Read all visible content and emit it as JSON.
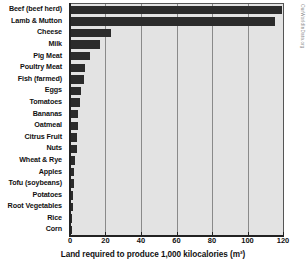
{
  "chart_data": {
    "type": "bar",
    "orientation": "horizontal",
    "title": "",
    "xlabel": "Land required to produce 1,000 kilocalories (m²)",
    "ylabel": "",
    "xlim": [
      0,
      120
    ],
    "xticks": [
      0,
      20,
      40,
      60,
      80,
      100,
      120
    ],
    "xtick_labels": [
      "0",
      "20",
      "40",
      "60",
      "80",
      "100",
      "120"
    ],
    "grid": true,
    "grid_axis": "x",
    "legend": false,
    "bar_color": "#2b2b2b",
    "plot_background": "#e3e3e3",
    "categories": [
      "Beef (beef herd)",
      "Lamb & Mutton",
      "Cheese",
      "Milk",
      "Pig Meat",
      "Poultry Meat",
      "Fish (farmed)",
      "Eggs",
      "Tomatoes",
      "Bananas",
      "Oatmeal",
      "Citrus Fruit",
      "Nuts",
      "Wheat & Rye",
      "Apples",
      "Tofu (soybeans)",
      "Potatoes",
      "Root Vegetables",
      "Rice",
      "Corn"
    ],
    "values": [
      119.5,
      115.5,
      23.0,
      17.0,
      11.0,
      8.6,
      8.0,
      6.3,
      5.4,
      4.6,
      4.3,
      4.1,
      3.9,
      2.6,
      2.3,
      2.2,
      1.9,
      1.7,
      1.3,
      1.1
    ]
  },
  "source_note": "OurWorldInData.org"
}
